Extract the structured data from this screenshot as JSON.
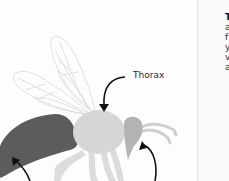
{
  "diagram": {
    "labels": {
      "thorax": "Thorax"
    },
    "colors": {
      "abdomen": "#5c5c5c",
      "thorax": "#d6d6d6",
      "head": "#b3b3b3",
      "legs": "#dcdcdc",
      "wings": "#dadada",
      "arrow": "#111111"
    }
  },
  "side_text": {
    "lines": [
      "",
      "T",
      "a",
      "f",
      "y",
      "v",
      "a"
    ]
  }
}
